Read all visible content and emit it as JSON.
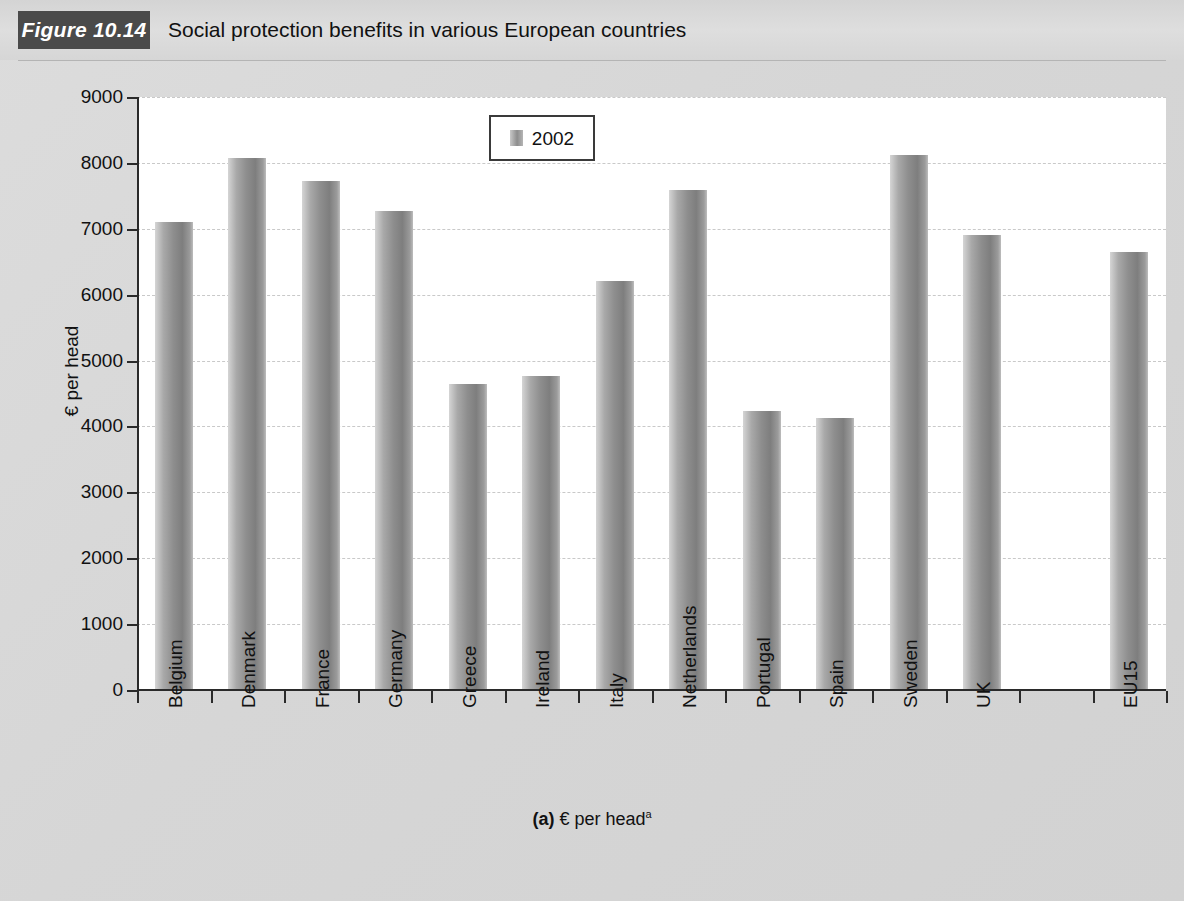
{
  "header": {
    "figure_badge": "Figure 10.14",
    "title": "Social protection benefits in various European countries"
  },
  "caption": {
    "prefix": "(a)",
    "text": "€ per head",
    "footnote_marker": "a"
  },
  "legend": {
    "position": "top-center-inside",
    "entries": [
      {
        "label": "2002",
        "swatch": "bar-swatch-gray"
      }
    ]
  },
  "chart_data": {
    "type": "bar",
    "title": "Social protection benefits in various European countries",
    "subtitle": "",
    "xlabel": "",
    "ylabel": "€ per head",
    "ylim": [
      0,
      9000
    ],
    "ytick_interval": 1000,
    "ytick_labels": [
      "9000",
      "8000",
      "7000",
      "6000",
      "5000",
      "4000",
      "3000",
      "2000",
      "1000",
      "0"
    ],
    "grid": true,
    "grid_axis": "y",
    "grid_style": "dashed",
    "legend_position": "top-center",
    "bar_color": "#8e8e8e",
    "categories": [
      "Belgium",
      "Denmark",
      "France",
      "Germany",
      "Greece",
      "Ireland",
      "Italy",
      "Netherlands",
      "Portugal",
      "Spain",
      "Sweden",
      "UK",
      "",
      "EU15"
    ],
    "series": [
      {
        "name": "2002",
        "values": [
          7100,
          8080,
          7720,
          7270,
          4650,
          4770,
          6210,
          7590,
          4230,
          4130,
          8120,
          6910,
          null,
          6650
        ]
      }
    ]
  }
}
